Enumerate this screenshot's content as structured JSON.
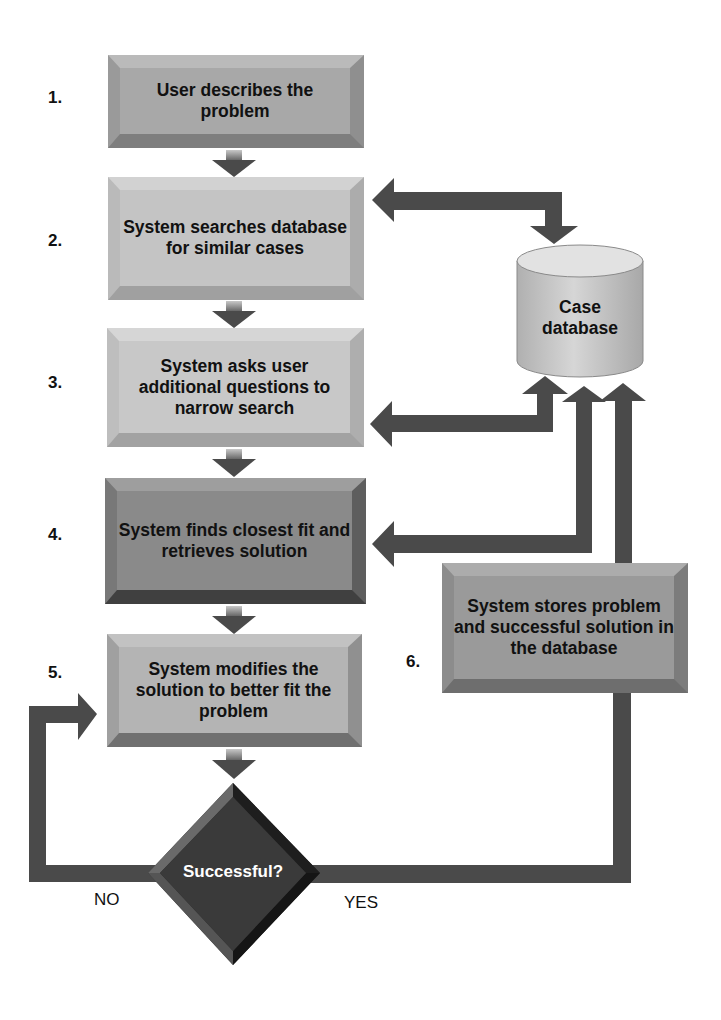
{
  "diagram": {
    "steps": [
      {
        "number": "1.",
        "text": "User describes the problem"
      },
      {
        "number": "2.",
        "text": "System searches database for similar cases"
      },
      {
        "number": "3.",
        "text": "System asks user additional questions to narrow search"
      },
      {
        "number": "4.",
        "text": "System finds closest fit and retrieves solution"
      },
      {
        "number": "5.",
        "text": "System modifies the solution to better fit the problem"
      },
      {
        "number": "6.",
        "text": "System stores problem and successful solution in the database"
      }
    ],
    "decision": {
      "text": "Successful?",
      "no_label": "NO",
      "yes_label": "YES"
    },
    "database": {
      "line1": "Case",
      "line2": "database"
    },
    "colors": {
      "arrow": "#4a4a4a",
      "box_light": "#c4c4c4",
      "box_mid": "#a8a8a8",
      "box_dark": "#8a8a8a",
      "decision": "#3a3a3a"
    }
  }
}
